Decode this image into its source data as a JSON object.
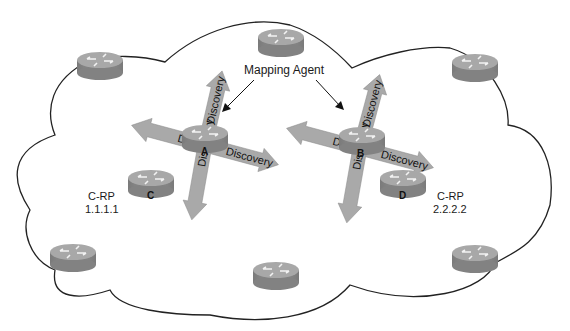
{
  "diagram": {
    "annotation": {
      "mapping_agent_label": "Mapping Agent"
    },
    "arrow_label": "Discovery",
    "mapping_agents": [
      {
        "id": "A",
        "label": "A"
      },
      {
        "id": "B",
        "label": "B"
      }
    ],
    "candidate_rps": [
      {
        "id": "C",
        "label": "C",
        "role": "C-RP",
        "address": "1.1.1.1"
      },
      {
        "id": "D",
        "label": "D",
        "role": "C-RP",
        "address": "2.2.2.2"
      }
    ],
    "edge_routers_count": 6,
    "colors": {
      "router_body": "#8c8c8c",
      "router_top": "#a6a6a6",
      "arrow_fill": "#a9a9a9",
      "cloud_stroke": "#222222",
      "background": "#ffffff"
    }
  }
}
